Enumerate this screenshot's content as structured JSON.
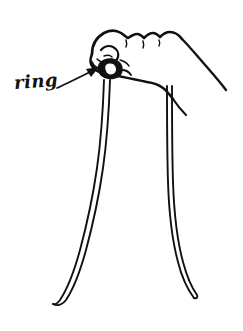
{
  "figure": {
    "background_color": "#ffffff",
    "ink_color": "#111111",
    "style": "black-and-white pen line art",
    "width": 243,
    "height": 331
  },
  "annotations": {
    "ring": {
      "label": "ring",
      "pointer": "arrow",
      "arrow_from": "88,88",
      "arrow_to": "107,66",
      "label_position": "14,74"
    }
  },
  "parts": {
    "hand": "fist-outline",
    "knuckles": "knuckle-bumps",
    "thumb": "thumb-outline",
    "forearm": "forearm-outline",
    "knot": "ring-knot",
    "cord_left": "cord-left-strand",
    "cord_right": "cord-right-strand"
  }
}
